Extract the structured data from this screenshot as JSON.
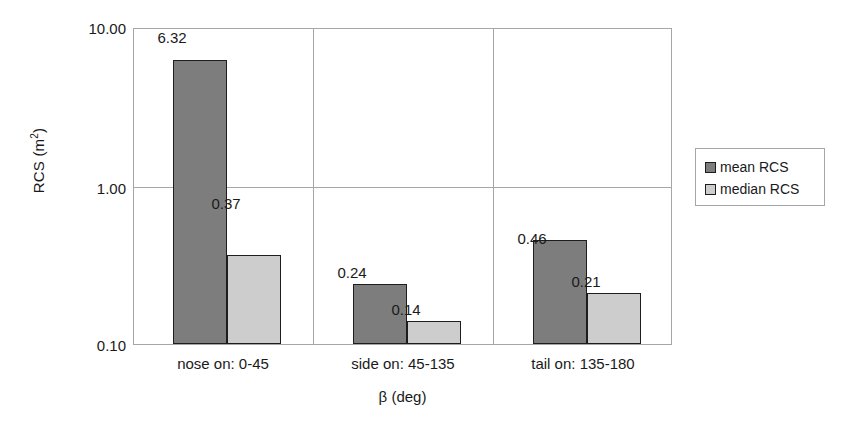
{
  "chart_data": {
    "type": "bar",
    "title": "",
    "subtitle": "",
    "xlabel": "β (deg)",
    "ylabel": "RCS (m²)",
    "ylabel_base": "RCS (m",
    "ylabel_exp": "2",
    "ylabel_close": ")",
    "categories": [
      "nose on:  0-45",
      "side on: 45-135",
      "tail on: 135-180"
    ],
    "series": [
      {
        "name": "mean RCS",
        "values": [
          6.32,
          0.24,
          0.46
        ],
        "labels": [
          "6.32",
          "0.24",
          "0.46"
        ],
        "color": "#7d7d7d"
      },
      {
        "name": "median RCS",
        "values": [
          0.37,
          0.14,
          0.21
        ],
        "labels": [
          "0.37",
          "0.14",
          "0.21"
        ],
        "color": "#cdcdcd"
      }
    ],
    "yscale": "log",
    "ylim": [
      0.1,
      10.0
    ],
    "yticks": [
      10.0,
      1.0,
      0.1
    ],
    "ytick_labels": [
      "10.00",
      "1.00",
      "0.10"
    ],
    "grid": "horizontal-and-category-separators",
    "legend_position": "right",
    "axis_color": "#a6a6a6",
    "bar_border_color": "#1d1d1d",
    "text_color": "#1a1a1a"
  },
  "legend": {
    "entries": [
      {
        "label": "mean RCS",
        "color": "#7d7d7d"
      },
      {
        "label": "median RCS",
        "color": "#cdcdcd"
      }
    ]
  }
}
